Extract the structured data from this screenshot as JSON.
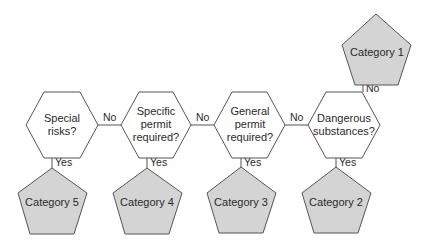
{
  "diagram": {
    "type": "flowchart",
    "colors": {
      "decision_fill": "#ffffff",
      "category_fill": "#d4d4d4",
      "stroke": "#555555",
      "text": "#2a2a2a"
    },
    "decisions": [
      {
        "id": "d1",
        "lines": [
          "Special",
          "risks?"
        ]
      },
      {
        "id": "d2",
        "lines": [
          "Specific",
          "permit",
          "required?"
        ]
      },
      {
        "id": "d3",
        "lines": [
          "General",
          "permit",
          "required?"
        ]
      },
      {
        "id": "d4",
        "lines": [
          "Dangerous",
          "substances?"
        ]
      }
    ],
    "categories": [
      {
        "id": "c1",
        "label": "Category 1"
      },
      {
        "id": "c2",
        "label": "Category 2"
      },
      {
        "id": "c3",
        "label": "Category 3"
      },
      {
        "id": "c4",
        "label": "Category 4"
      },
      {
        "id": "c5",
        "label": "Category 5"
      }
    ],
    "edges": [
      {
        "from": "d1",
        "to": "c5",
        "label": "Yes"
      },
      {
        "from": "d1",
        "to": "d2",
        "label": "No"
      },
      {
        "from": "d2",
        "to": "c4",
        "label": "Yes"
      },
      {
        "from": "d2",
        "to": "d3",
        "label": "No"
      },
      {
        "from": "d3",
        "to": "c3",
        "label": "Yes"
      },
      {
        "from": "d3",
        "to": "d4",
        "label": "No"
      },
      {
        "from": "d4",
        "to": "c2",
        "label": "Yes"
      },
      {
        "from": "d4",
        "to": "c1",
        "label": "No"
      }
    ]
  }
}
